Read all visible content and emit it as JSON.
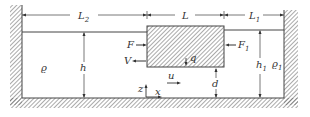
{
  "diagram": {
    "type": "floating body in channel between two fluid regions",
    "colors": {
      "line": "#444444",
      "hatch": "#555555",
      "background": "#ffffff"
    },
    "dimensions": {
      "L2": {
        "label": "L",
        "sub": "2"
      },
      "L": {
        "label": "L",
        "sub": ""
      },
      "L1": {
        "label": "L",
        "sub": "1"
      },
      "h": {
        "label": "h",
        "sub": ""
      },
      "h1": {
        "label": "h",
        "sub": "1"
      },
      "d": {
        "label": "d",
        "sub": ""
      }
    },
    "densities": {
      "left": {
        "label": "ϱ",
        "sub": ""
      },
      "right": {
        "label": "ϱ",
        "sub": "1"
      }
    },
    "forces": {
      "F": {
        "label": "F",
        "sub": ""
      },
      "F1": {
        "label": "F",
        "sub": "1"
      },
      "V": {
        "label": "V",
        "sub": ""
      },
      "q": {
        "label": "q",
        "sub": ""
      },
      "u": {
        "label": "u",
        "sub": ""
      }
    },
    "axes": {
      "z": {
        "label": "z"
      },
      "x": {
        "label": "x"
      }
    }
  }
}
